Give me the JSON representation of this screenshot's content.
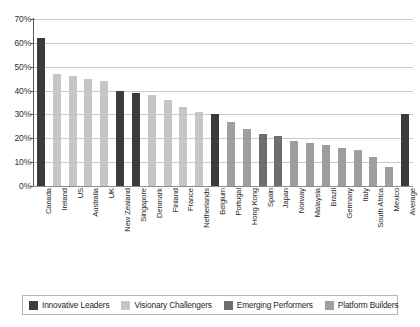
{
  "chart_data": {
    "type": "bar",
    "title": "",
    "subtitle": "",
    "xlabel": "",
    "ylabel": "",
    "ylim": [
      0,
      70
    ],
    "grid": true,
    "legend_position": "bottom",
    "ytick_labels": [
      "70%",
      "60%",
      "50%",
      "40%",
      "30%",
      "20%",
      "10%",
      "0%"
    ],
    "ytick_values": [
      70,
      60,
      50,
      40,
      30,
      20,
      10,
      0
    ],
    "categories": [
      "Canada",
      "Ireland",
      "US",
      "Australia",
      "UK",
      "New Zealand",
      "Singapore",
      "Denmark",
      "Finland",
      "France",
      "Netherlands",
      "Belgium",
      "Portugal",
      "Hong Kong",
      "Spain",
      "Japan",
      "Norway",
      "Malaysia",
      "Brazil",
      "Germany",
      "Italy",
      "South Africa",
      "Mexico",
      "Average"
    ],
    "values": [
      62,
      47,
      46,
      45,
      44,
      40,
      39,
      38,
      36,
      33,
      31,
      30,
      27,
      24,
      22,
      21,
      19,
      18,
      17,
      16,
      15,
      12,
      8,
      30
    ],
    "point_categories": [
      "Innovative Leaders",
      "Visionary Challengers",
      "Visionary Challengers",
      "Visionary Challengers",
      "Visionary Challengers",
      "Innovative Leaders",
      "Innovative Leaders",
      "Visionary Challengers",
      "Visionary Challengers",
      "Visionary Challengers",
      "Visionary Challengers",
      "Innovative Leaders",
      "Platform Builders",
      "Platform Builders",
      "Emerging Performers",
      "Emerging Performers",
      "Platform Builders",
      "Platform Builders",
      "Platform Builders",
      "Platform Builders",
      "Platform Builders",
      "Platform Builders",
      "Platform Builders",
      "Innovative Leaders"
    ],
    "series": [
      {
        "name": "Innovative Leaders",
        "color": "#3b3b3b",
        "members": [
          "Canada",
          "New Zealand",
          "Singapore",
          "Belgium",
          "Average"
        ]
      },
      {
        "name": "Visionary Challengers",
        "color": "#c6c6c6",
        "members": [
          "Ireland",
          "US",
          "Australia",
          "UK",
          "Denmark",
          "Finland",
          "France",
          "Netherlands"
        ]
      },
      {
        "name": "Emerging Performers",
        "color": "#6e6e6e",
        "members": [
          "Spain",
          "Japan"
        ]
      },
      {
        "name": "Platform Builders",
        "color": "#9e9e9e",
        "members": [
          "Portugal",
          "Hong Kong",
          "Norway",
          "Malaysia",
          "Brazil",
          "Germany",
          "Italy",
          "South Africa",
          "Mexico"
        ]
      }
    ]
  },
  "legend": {
    "items": [
      {
        "label": "Innovative Leaders",
        "color": "#3b3b3b",
        "swatch_class": "sw-innovative"
      },
      {
        "label": "Visionary Challengers",
        "color": "#c6c6c6",
        "swatch_class": "sw-visionary"
      },
      {
        "label": "Emerging Performers",
        "color": "#6e6e6e",
        "swatch_class": "sw-emerging"
      },
      {
        "label": "Platform Builders",
        "color": "#9e9e9e",
        "swatch_class": "sw-platform"
      }
    ]
  }
}
